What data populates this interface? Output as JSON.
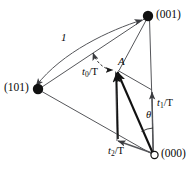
{
  "figure": {
    "background_color": "#ffffff",
    "line_color": "#55565a",
    "heavy_line_color": "#111111",
    "node_fill": "#111111",
    "node_open_fill": "#ffffff",
    "text_color": "#0a0a0a"
  },
  "nodes": [
    {
      "id": "n001",
      "label": "(001)",
      "style": "filled",
      "x": 148,
      "y": 16,
      "label_x": 156,
      "label_y": 10
    },
    {
      "id": "n101",
      "label": "(101)",
      "style": "filled",
      "x": 38,
      "y": 89,
      "label_x": 5,
      "label_y": 84
    },
    {
      "id": "n000",
      "label": "(000)",
      "style": "open",
      "x": 154,
      "y": 155,
      "label_x": 161,
      "label_y": 149
    },
    {
      "id": "nA",
      "label": "A",
      "style": "point",
      "x": 117,
      "y": 70,
      "label_x": 118,
      "label_y": 57
    }
  ],
  "vector_labels": [
    {
      "id": "t0",
      "base": "t",
      "sub": "0",
      "denom": "/T",
      "text": "t0/T",
      "x": 83,
      "y": 68
    },
    {
      "id": "t1",
      "base": "t",
      "sub": "1",
      "denom": "/T",
      "text": "t1/T",
      "x": 157,
      "y": 99
    },
    {
      "id": "t2",
      "base": "t",
      "sub": "2",
      "denom": "/T",
      "text": "t2/T",
      "x": 109,
      "y": 147
    }
  ],
  "annotations": [
    {
      "id": "unit",
      "text": "1",
      "x": 61,
      "y": 33
    },
    {
      "id": "theta",
      "text": "θ",
      "x": 146,
      "y": 111
    }
  ]
}
